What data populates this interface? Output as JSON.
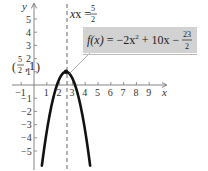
{
  "chart_data": {
    "type": "line",
    "title": "",
    "function": "f(x) = -2x^2 + 10x - 23/2",
    "function_label": {
      "lhs": "f(x)",
      "eq": " = ",
      "t1": "−2x",
      "exp": "2",
      "t2": " + 10x − ",
      "num": "23",
      "den": "2"
    },
    "xlabel": "x",
    "ylabel": "y",
    "xlim": [
      -1.5,
      10
    ],
    "ylim": [
      -6.1,
      6.2
    ],
    "x_ticks": [
      "−1",
      "1",
      "2",
      "3",
      "4",
      "5",
      "6",
      "7",
      "8",
      "9"
    ],
    "x_tick_values": [
      -1,
      1,
      2,
      3,
      4,
      5,
      6,
      7,
      8,
      9
    ],
    "y_ticks": [
      "5",
      "4",
      "3",
      "2",
      "1",
      "−1",
      "−2",
      "−3",
      "−4",
      "−5"
    ],
    "y_tick_values": [
      5,
      4,
      3,
      2,
      1,
      -1,
      -2,
      -3,
      -4,
      -5
    ],
    "vertex": {
      "x": 2.5,
      "y": 1,
      "label_num": "5",
      "label_den": "2",
      "label_y": "1"
    },
    "axis_of_symmetry": {
      "label": "x = ",
      "num": "5",
      "den": "2",
      "value": 2.5
    },
    "series": [
      {
        "name": "f(x)",
        "x": [
          0.615,
          1,
          1.5,
          2,
          2.5,
          3,
          3.5,
          4,
          4.385
        ],
        "y": [
          -6.1,
          -3.5,
          -0.5,
          0.5,
          1,
          0.5,
          -0.5,
          -3.5,
          -6.1
        ]
      }
    ],
    "grid": false,
    "legend": "boxed label, upper right"
  }
}
